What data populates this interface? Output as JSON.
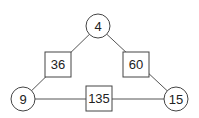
{
  "diagram": {
    "type": "product-triangle",
    "nodes": [
      {
        "id": "top",
        "shape": "circle",
        "label": "4"
      },
      {
        "id": "left",
        "shape": "circle",
        "label": "9"
      },
      {
        "id": "right",
        "shape": "circle",
        "label": "15"
      },
      {
        "id": "left-edge",
        "shape": "square",
        "label": "36"
      },
      {
        "id": "right-edge",
        "shape": "square",
        "label": "60"
      },
      {
        "id": "bottom-edge",
        "shape": "square",
        "label": "135"
      }
    ],
    "edges": [
      {
        "from": "top",
        "via": "left-edge",
        "to": "left"
      },
      {
        "from": "top",
        "via": "right-edge",
        "to": "right"
      },
      {
        "from": "left",
        "via": "bottom-edge",
        "to": "right"
      }
    ]
  }
}
